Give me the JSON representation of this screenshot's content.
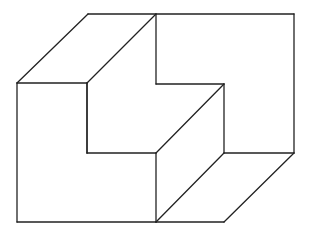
{
  "figure": {
    "title": "",
    "stroke_color": "#222222",
    "background_color": "#ffffff"
  },
  "points": {
    "A": [
      88,
      14
    ],
    "B": [
      156,
      14
    ],
    "C": [
      294,
      14
    ],
    "D": [
      17,
      83
    ],
    "E": [
      87,
      83
    ],
    "F": [
      156,
      84
    ],
    "G": [
      224,
      84
    ],
    "H": [
      87,
      153
    ],
    "I": [
      156,
      153
    ],
    "J": [
      224,
      153
    ],
    "K": [
      294,
      153
    ],
    "L": [
      17,
      222
    ],
    "M": [
      156,
      222
    ],
    "N": [
      224,
      222
    ]
  },
  "edges": [
    [
      "A",
      "C"
    ],
    [
      "A",
      "D"
    ],
    [
      "B",
      "E"
    ],
    [
      "B",
      "F"
    ],
    [
      "C",
      "K"
    ],
    [
      "D",
      "E"
    ],
    [
      "D",
      "L"
    ],
    [
      "E",
      "H"
    ],
    [
      "F",
      "G"
    ],
    [
      "G",
      "J"
    ],
    [
      "G",
      "I"
    ],
    [
      "H",
      "I"
    ],
    [
      "H",
      "E"
    ],
    [
      "I",
      "M"
    ],
    [
      "J",
      "K"
    ],
    [
      "J",
      "M"
    ],
    [
      "K",
      "N"
    ],
    [
      "L",
      "M"
    ],
    [
      "M",
      "N"
    ]
  ]
}
